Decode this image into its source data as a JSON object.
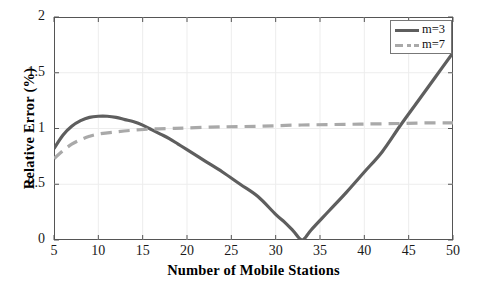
{
  "chart_data": {
    "type": "line",
    "title": "",
    "xlabel": "Number of Mobile Stations",
    "ylabel": "Relative Error (%)",
    "xlim": [
      5,
      50
    ],
    "ylim": [
      0,
      2
    ],
    "xticks": [
      5,
      10,
      15,
      20,
      25,
      30,
      35,
      40,
      45,
      50
    ],
    "yticks": [
      0,
      0.5,
      1,
      1.5,
      2
    ],
    "xtick_labels": [
      "5",
      "10",
      "15",
      "20",
      "25",
      "30",
      "35",
      "40",
      "45",
      "50"
    ],
    "ytick_labels": [
      "0",
      "0.5",
      "1",
      "1.5",
      "2"
    ],
    "grid": true,
    "legend_position": "upper right",
    "series": [
      {
        "name": "m=3",
        "style": "solid",
        "color": "#5e5e5e",
        "width": 3.2,
        "x": [
          5,
          6,
          7,
          8,
          9,
          10,
          11,
          12,
          13,
          14,
          15,
          16,
          17,
          18,
          19,
          20,
          22,
          24,
          26,
          28,
          30,
          31,
          32,
          33,
          34,
          36,
          38,
          40,
          42,
          44,
          46,
          48,
          50
        ],
        "y": [
          0.82,
          0.94,
          1.02,
          1.07,
          1.1,
          1.11,
          1.11,
          1.1,
          1.08,
          1.06,
          1.03,
          0.99,
          0.95,
          0.91,
          0.86,
          0.81,
          0.71,
          0.61,
          0.5,
          0.39,
          0.23,
          0.16,
          0.08,
          0.0,
          0.09,
          0.26,
          0.43,
          0.61,
          0.79,
          1.02,
          1.24,
          1.46,
          1.68
        ]
      },
      {
        "name": "m=7",
        "style": "dashed",
        "color": "#a9a9a9",
        "width": 3.2,
        "x": [
          5,
          6,
          7,
          8,
          9,
          10,
          12,
          14,
          16,
          18,
          20,
          24,
          28,
          32,
          36,
          40,
          44,
          47,
          50
        ],
        "y": [
          0.73,
          0.8,
          0.86,
          0.9,
          0.93,
          0.95,
          0.97,
          0.985,
          0.995,
          1.0,
          1.005,
          1.015,
          1.02,
          1.03,
          1.035,
          1.04,
          1.045,
          1.05,
          1.05
        ]
      }
    ]
  },
  "legend": {
    "entries": [
      {
        "label": "m=3"
      },
      {
        "label": "m=7"
      }
    ]
  },
  "colors": {
    "series_m3": "#5e5e5e",
    "series_m7": "#a9a9a9",
    "axis": "#555555",
    "grid": "#ededed",
    "text": "#111111",
    "background": "#ffffff"
  }
}
